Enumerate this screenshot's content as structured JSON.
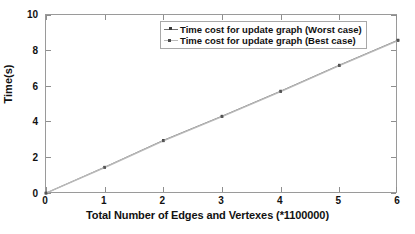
{
  "chart_data": {
    "type": "line",
    "title": "",
    "xlabel": "Total Number of Edges and Vertexes (*1100000)",
    "ylabel": "Time(s)",
    "xlim": [
      0,
      6
    ],
    "ylim": [
      0,
      10
    ],
    "xticks": [
      "0",
      "1",
      "2",
      "3",
      "4",
      "5",
      "6"
    ],
    "yticks": [
      "0",
      "2",
      "4",
      "6",
      "8",
      "10"
    ],
    "xtick_values": [
      0,
      1,
      2,
      3,
      4,
      5,
      6
    ],
    "ytick_values": [
      0,
      2,
      4,
      6,
      8,
      10
    ],
    "grid": false,
    "legend_position": "upper center",
    "x": [
      0,
      1,
      2,
      3,
      4,
      5,
      6
    ],
    "series": [
      {
        "name": "Time cost for update graph (Worst case)",
        "values": [
          0.05,
          1.5,
          3.0,
          4.35,
          5.75,
          7.2,
          8.6
        ],
        "color": "#6f6f6f",
        "marker": "square"
      },
      {
        "name": "Time cost for update graph (Best case)",
        "values": [
          0.05,
          1.48,
          2.97,
          4.32,
          5.72,
          7.17,
          8.57
        ],
        "color": "#b9b9b9",
        "marker": "square"
      }
    ],
    "annotations": []
  },
  "legend": {
    "items": [
      {
        "label": "Time cost for update graph (Worst case)"
      },
      {
        "label": "Time cost for update graph (Best case)"
      }
    ]
  },
  "colors": {
    "background": "#ffffff",
    "axis": "#9a9a9a",
    "text": "#111111",
    "worst_case": "#6f6f6f",
    "best_case": "#b9b9b9"
  }
}
